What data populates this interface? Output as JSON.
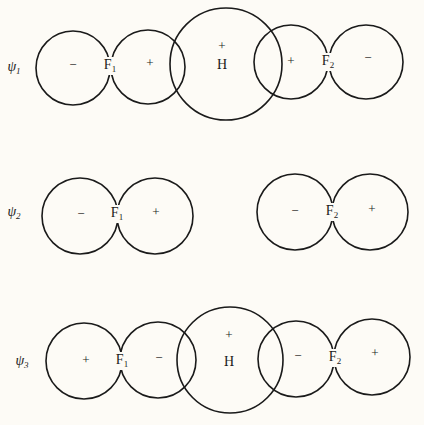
{
  "figure": {
    "type": "molecular-orbital-diagram",
    "rows": [
      {
        "id": "psi1",
        "label": "ψ",
        "label_sub": "1",
        "label_pos": [
          14,
          68
        ],
        "circles": [
          {
            "cx": 73,
            "cy": 68,
            "r": 37,
            "sign": "−",
            "sign_pos": [
              73,
              66
            ]
          },
          {
            "cx": 148,
            "cy": 67,
            "r": 37,
            "sign": "+",
            "sign_pos": [
              150,
              64
            ]
          },
          {
            "cx": 226,
            "cy": 64,
            "r": 56,
            "sign": "+",
            "sign_pos": [
              222,
              47
            ]
          },
          {
            "cx": 291,
            "cy": 62,
            "r": 37,
            "sign": "+",
            "sign_pos": [
              291,
              62
            ]
          },
          {
            "cx": 366,
            "cy": 62,
            "r": 37,
            "sign": "−",
            "sign_pos": [
              368,
              59
            ]
          }
        ],
        "atoms": [
          {
            "text": "F",
            "sub": "1",
            "pos": [
              110,
              66
            ]
          },
          {
            "text": "H",
            "sub": "",
            "pos": [
              222,
              66
            ]
          },
          {
            "text": "F",
            "sub": "2",
            "pos": [
              328,
              62
            ]
          }
        ]
      },
      {
        "id": "psi2",
        "label": "ψ",
        "label_sub": "2",
        "label_pos": [
          14,
          213
        ],
        "circles": [
          {
            "cx": 80,
            "cy": 216,
            "r": 38,
            "sign": "−",
            "sign_pos": [
              81,
              215
            ]
          },
          {
            "cx": 155,
            "cy": 216,
            "r": 38,
            "sign": "+",
            "sign_pos": [
              156,
              213
            ]
          },
          {
            "cx": 295,
            "cy": 212,
            "r": 38,
            "sign": "−",
            "sign_pos": [
              295,
              212
            ]
          },
          {
            "cx": 370,
            "cy": 212,
            "r": 38,
            "sign": "+",
            "sign_pos": [
              372,
              210
            ]
          }
        ],
        "atoms": [
          {
            "text": "F",
            "sub": "1",
            "pos": [
              117,
              214
            ]
          },
          {
            "text": "F",
            "sub": "2",
            "pos": [
              332,
              212
            ]
          }
        ]
      },
      {
        "id": "psi3",
        "label": "ψ",
        "label_sub": "3",
        "label_pos": [
          22,
          362
        ],
        "circles": [
          {
            "cx": 84,
            "cy": 361,
            "r": 38,
            "sign": "+",
            "sign_pos": [
              86,
              361
            ]
          },
          {
            "cx": 158,
            "cy": 360,
            "r": 38,
            "sign": "−",
            "sign_pos": [
              159,
              359
            ]
          },
          {
            "cx": 230,
            "cy": 360,
            "r": 53,
            "sign": "+",
            "sign_pos": [
              229,
              336
            ]
          },
          {
            "cx": 296,
            "cy": 359,
            "r": 38,
            "sign": "−",
            "sign_pos": [
              298,
              357
            ]
          },
          {
            "cx": 372,
            "cy": 357,
            "r": 38,
            "sign": "+",
            "sign_pos": [
              375,
              354
            ]
          }
        ],
        "atoms": [
          {
            "text": "F",
            "sub": "1",
            "pos": [
              122,
              361
            ]
          },
          {
            "text": "H",
            "sub": "",
            "pos": [
              229,
              363
            ]
          },
          {
            "text": "F",
            "sub": "2",
            "pos": [
              335,
              358
            ]
          }
        ]
      }
    ]
  },
  "colors": {
    "background": "#fdfbf6",
    "ink": "#1a1a1a"
  }
}
